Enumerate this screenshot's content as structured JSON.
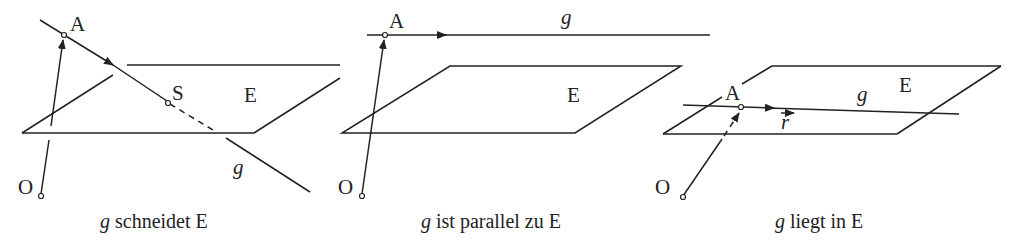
{
  "figure": {
    "panels": [
      {
        "id": "schneidet",
        "caption_var": "g",
        "caption_text": " schneidet E",
        "labels": {
          "A": "A",
          "S": "S",
          "E": "E",
          "g": "g",
          "O": "O"
        }
      },
      {
        "id": "parallel",
        "caption_var": "g",
        "caption_text": " ist parallel zu E",
        "labels": {
          "A": "A",
          "E": "E",
          "g": "g",
          "O": "O"
        }
      },
      {
        "id": "liegt",
        "caption_var": "g",
        "caption_text": " liegt in E",
        "labels": {
          "A": "A",
          "E": "E",
          "g": "g",
          "O": "O",
          "r": "r"
        }
      }
    ],
    "colors": {
      "stroke": "#222222",
      "background": "#ffffff"
    }
  }
}
